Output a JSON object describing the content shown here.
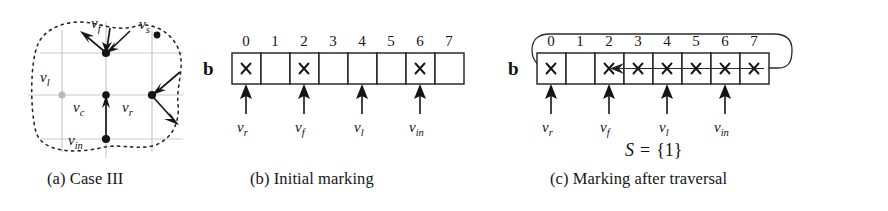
{
  "figure": {
    "panels": [
      {
        "id": "a",
        "caption": "(a) Case III",
        "type": "graph-diagram",
        "node_labels": [
          "v_f",
          "v_s",
          "v_l",
          "v_c",
          "v_r",
          "v_in"
        ],
        "nodes": [
          {
            "name": "v_f",
            "label_main": "v",
            "label_sub": "f",
            "x": 106,
            "y": 53,
            "filled": true
          },
          {
            "name": "v_s",
            "label_main": "v",
            "label_sub": "s",
            "x": 157,
            "y": 35,
            "filled": true
          },
          {
            "name": "v_l",
            "label_main": "v",
            "label_sub": "l",
            "x": 62,
            "y": 95,
            "filled": false
          },
          {
            "name": "v_c",
            "label_main": "v",
            "label_sub": "c",
            "x": 106,
            "y": 95,
            "filled": true
          },
          {
            "name": "v_r",
            "label_main": "v",
            "label_sub": "r",
            "x": 152,
            "y": 95,
            "filled": true
          },
          {
            "name": "v_in",
            "label_main": "v",
            "label_sub": "in",
            "x": 106,
            "y": 139,
            "filled": true
          }
        ]
      },
      {
        "id": "b",
        "caption": "(b) Initial marking",
        "type": "array",
        "array_name": "b",
        "indices": [
          "0",
          "1",
          "2",
          "3",
          "4",
          "5",
          "6",
          "7"
        ],
        "cells": [
          {
            "index": "0",
            "marked": true
          },
          {
            "index": "1",
            "marked": false
          },
          {
            "index": "2",
            "marked": true
          },
          {
            "index": "3",
            "marked": false
          },
          {
            "index": "4",
            "marked": false
          },
          {
            "index": "5",
            "marked": false
          },
          {
            "index": "6",
            "marked": true
          },
          {
            "index": "7",
            "marked": false
          }
        ],
        "pointers": [
          {
            "name": "v_r",
            "label_main": "v",
            "label_sub": "r",
            "cell": 0
          },
          {
            "name": "v_f",
            "label_main": "v",
            "label_sub": "f",
            "cell": 2
          },
          {
            "name": "v_l",
            "label_main": "v",
            "label_sub": "l",
            "cell": 4
          },
          {
            "name": "v_in",
            "label_main": "v",
            "label_sub": "in",
            "cell": 6
          }
        ]
      },
      {
        "id": "c",
        "caption": "(c) Marking after traversal",
        "type": "array",
        "array_name": "b",
        "indices": [
          "0",
          "1",
          "2",
          "3",
          "4",
          "5",
          "6",
          "7"
        ],
        "cells": [
          {
            "index": "0",
            "marked": true
          },
          {
            "index": "1",
            "marked": false
          },
          {
            "index": "2",
            "marked": true
          },
          {
            "index": "3",
            "marked": true
          },
          {
            "index": "4",
            "marked": true
          },
          {
            "index": "5",
            "marked": true
          },
          {
            "index": "6",
            "marked": true
          },
          {
            "index": "7",
            "marked": true
          }
        ],
        "pointers": [
          {
            "name": "v_r",
            "label_main": "v",
            "label_sub": "r",
            "cell": 0
          },
          {
            "name": "v_f",
            "label_main": "v",
            "label_sub": "f",
            "cell": 2
          },
          {
            "name": "v_l",
            "label_main": "v",
            "label_sub": "l",
            "cell": 4
          },
          {
            "name": "v_in",
            "label_main": "v",
            "label_sub": "in",
            "cell": 6
          }
        ],
        "set_annotation": {
          "name": "S",
          "equals": "=",
          "value": "{1}"
        },
        "wrap_arrow": {
          "from_cell": 7,
          "to_cell": 2,
          "direction": "right-to-left-wrapping"
        }
      }
    ],
    "colors": {
      "ink": "#151515",
      "grid": "#c9c9c9",
      "inactive_node": "#b9b9b9",
      "background": "#ffffff"
    }
  }
}
